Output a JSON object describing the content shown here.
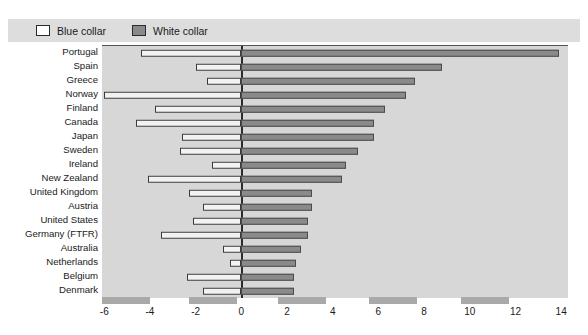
{
  "legend": {
    "items": [
      {
        "label": "Blue collar",
        "swatch": "legend-swatch-blue",
        "color": "#ffffff"
      },
      {
        "label": "White collar",
        "swatch": "legend-swatch-white",
        "color": "#8a8a8a"
      }
    ]
  },
  "chart_data": {
    "type": "bar",
    "orientation": "horizontal",
    "title": "",
    "subtitle": "",
    "xlabel": "",
    "ylabel": "",
    "xlim": [
      -6.1,
      14.3
    ],
    "xticks": [
      -6,
      -4,
      -2,
      0,
      2,
      4,
      6,
      8,
      10,
      12,
      14
    ],
    "xticklabels": [
      "-6",
      "-4",
      "-2",
      "0",
      "2",
      "4",
      "6",
      "8",
      "10",
      "12",
      "14"
    ],
    "grid": false,
    "legend_position": "top-left",
    "zero_line": 0,
    "categories": [
      "Portugal",
      "Spain",
      "Greece",
      "Norway",
      "Finland",
      "Canada",
      "Japan",
      "Sweden",
      "Ireland",
      "New Zealand",
      "United Kingdom",
      "Austria",
      "United States",
      "Germany (FTFR)",
      "Australia",
      "Netherlands",
      "Belgium",
      "Denmark"
    ],
    "series": [
      {
        "name": "Blue collar",
        "color": "#ffffff",
        "values": [
          -4.4,
          -2.0,
          -1.5,
          -6.0,
          -3.8,
          -4.6,
          -2.6,
          -2.7,
          -1.3,
          -4.1,
          -2.3,
          -1.7,
          -2.1,
          -3.5,
          -0.8,
          -0.5,
          -2.4,
          -1.7
        ]
      },
      {
        "name": "White collar",
        "color": "#8a8a8a",
        "values": [
          13.9,
          8.8,
          7.6,
          7.2,
          6.3,
          5.8,
          5.8,
          5.1,
          4.6,
          4.4,
          3.1,
          3.1,
          2.9,
          2.9,
          2.6,
          2.4,
          2.3,
          2.3
        ]
      }
    ]
  }
}
